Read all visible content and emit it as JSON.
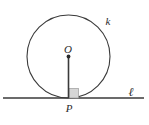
{
  "figure": {
    "background_color": "#ffffff",
    "stroke_color": "#3a3a3a",
    "label_color": "#2b2b2b",
    "right_angle_fill": "#d6d6d6",
    "right_angle_stroke": "#9a9a9a"
  },
  "circle": {
    "label": "k",
    "center_x": 68.5,
    "center_y": 56.5,
    "radius": 41.5,
    "stroke_width": 1.1
  },
  "center_point": {
    "label": "O",
    "x": 68.5,
    "y": 56.5,
    "dot_radius": 1.9
  },
  "tangent_point": {
    "label": "P",
    "x": 68.5,
    "y": 98
  },
  "radius_segment": {
    "x1": 68.5,
    "y1": 56.5,
    "x2": 68.5,
    "y2": 98,
    "stroke_width": 1.6
  },
  "tangent_line": {
    "label": "ℓ",
    "x1": 3,
    "y1": 98,
    "x2": 144,
    "y2": 98,
    "stroke_width": 1.4
  },
  "right_angle_marker": {
    "x": 69,
    "y": 88.5,
    "size": 9.5
  },
  "labels": {
    "circle_label": {
      "text": "k",
      "x": 108,
      "y": 25,
      "font_size": 11
    },
    "center_label": {
      "text": "O",
      "x": 68,
      "y": 53,
      "font_size": 11
    },
    "tangent_point_label": {
      "text": "P",
      "x": 69,
      "y": 112,
      "font_size": 11
    },
    "line_label": {
      "text": "ℓ",
      "x": 131,
      "y": 96,
      "font_size": 12
    }
  }
}
